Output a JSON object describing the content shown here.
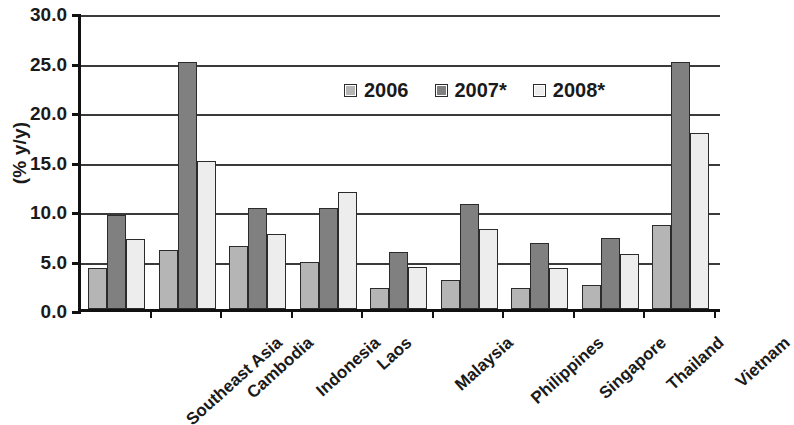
{
  "chart_data": {
    "type": "bar",
    "title": "",
    "xlabel": "",
    "ylabel": "(% y/y)",
    "ylim": [
      0,
      30
    ],
    "ytick_step": 5,
    "ytick_labels": [
      "30.0",
      "25.0",
      "20.0",
      "15.0",
      "10.0",
      "5.0",
      "0.0"
    ],
    "grid": true,
    "legend_position": "top-center",
    "note": "Vietnam 2008* bar is clipped by the right edge of the figure",
    "categories": [
      "Southeast Asia",
      "Cambodia",
      "Indonesia",
      "Laos",
      "Malaysia",
      "Philippines",
      "Singapore",
      "Thailand",
      "Vietnam"
    ],
    "series": [
      {
        "name": "2006",
        "color": "#b5b5b5",
        "values": [
          4.1,
          6.0,
          6.4,
          4.7,
          2.1,
          2.9,
          2.1,
          2.4,
          8.5
        ]
      },
      {
        "name": "2007*",
        "color": "#808080",
        "values": [
          9.5,
          25.0,
          10.2,
          10.2,
          5.8,
          10.6,
          6.7,
          7.2,
          25.0
        ]
      },
      {
        "name": "2008*",
        "color": "#ededed",
        "values": [
          7.1,
          15.0,
          7.6,
          11.8,
          4.2,
          8.1,
          4.1,
          5.6,
          17.8
        ]
      }
    ]
  }
}
